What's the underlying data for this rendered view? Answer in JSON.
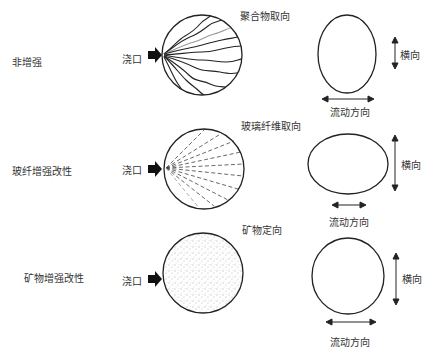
{
  "rows": [
    {
      "category": "非增强",
      "gate_label": "浇口",
      "orientation_label": "聚合物取向",
      "transverse_label": "横向",
      "flow_label": "流动方向"
    },
    {
      "category": "玻纤增强改性",
      "gate_label": "浇口",
      "orientation_label": "玻璃纤维取向",
      "transverse_label": "横向",
      "flow_label": "流动方向"
    },
    {
      "category": "矿物增强改性",
      "gate_label": "浇口",
      "orientation_label": "矿物定向",
      "transverse_label": "横向",
      "flow_label": "流动方向"
    }
  ]
}
